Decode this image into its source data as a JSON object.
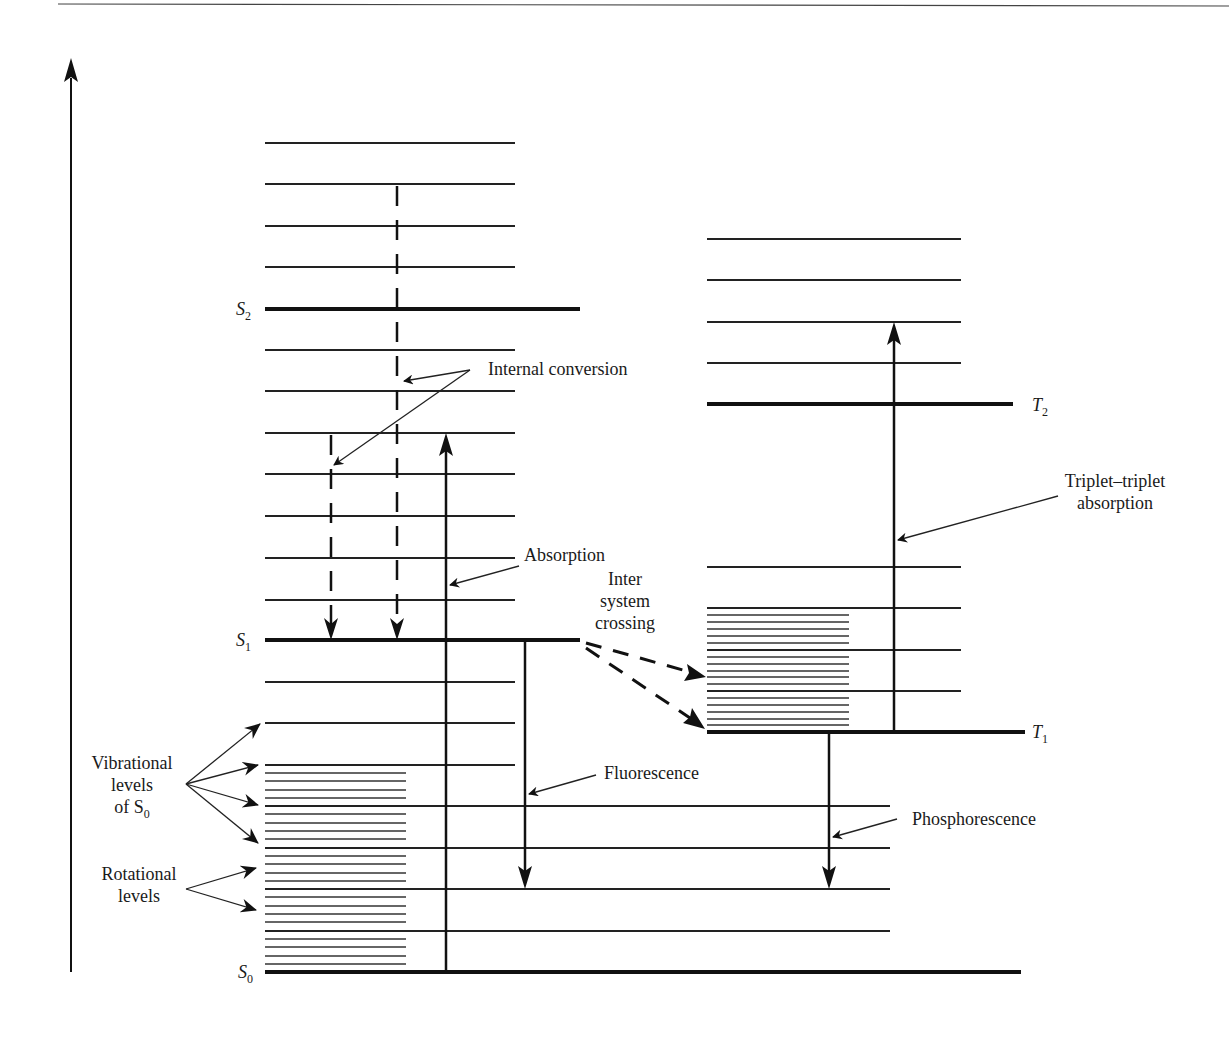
{
  "figure": {
    "states": {
      "S0": {
        "letter": "S",
        "sub": "0"
      },
      "S1": {
        "letter": "S",
        "sub": "1"
      },
      "S2": {
        "letter": "S",
        "sub": "2"
      },
      "T1": {
        "letter": "T",
        "sub": "1"
      },
      "T2": {
        "letter": "T",
        "sub": "2"
      }
    },
    "labels": {
      "internal_conversion": "Internal conversion",
      "absorption": "Absorption",
      "isc_line1": "Inter",
      "isc_line2": "system",
      "isc_line3": "crossing",
      "triplet_line1": "Triplet–triplet",
      "triplet_line2": "absorption",
      "fluorescence": "Fluorescence",
      "phosphorescence": "Phosphorescence",
      "vib_line1": "Vibrational",
      "vib_line2": "levels",
      "vib_line3": "of S",
      "vib_sub": "0",
      "rot_line1": "Rotational",
      "rot_line2": "levels"
    },
    "axis": {
      "label": "Energy (vertical axis, unlabeled)"
    }
  }
}
